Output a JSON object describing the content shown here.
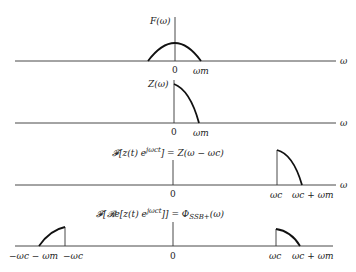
{
  "panels": [
    {
      "id": "F",
      "title": "F(ω)",
      "axis_symbol": "ω",
      "tick_labels": [
        "0",
        "ω_m"
      ],
      "ticks": {
        "zero": "0",
        "wm": "ωm"
      },
      "description": "Symmetric baseband spectrum from -ωm to ωm"
    },
    {
      "id": "Z",
      "title": "Z(ω)",
      "axis_symbol": "ω",
      "ticks": {
        "zero": "0",
        "wm": "ωm"
      },
      "description": "One-sided spectrum from 0 to ωm"
    },
    {
      "id": "Zshift",
      "title": "𝓕[z(t) e^{jω_c t}] = Z(ω − ω_c)",
      "title_parts": {
        "pre": "𝓕[z(t) e",
        "sup": "jωct",
        "post": "] = Z(ω − ωc)"
      },
      "axis_symbol": "ω",
      "ticks": {
        "zero": "0",
        "wc": "ωc",
        "wcwm": "ωc + ωm"
      },
      "description": "Shifted spectrum from ωc to ωc + ωm"
    },
    {
      "id": "SSB",
      "title": "𝓕[𝓡e[z(t) e^{jω_c t}]] = Φ_SSB+(ω)",
      "title_parts": {
        "pre": "𝓕[𝓡e[z(t) e",
        "sup": "jωct",
        "mid": "]] = Φ",
        "sub": "SSB+",
        "post": "(ω)"
      },
      "ticks": {
        "negwcwm": "−ωc − ωm",
        "negwc": "−ωc",
        "zero": "0",
        "wc": "ωc",
        "wcwm": "ωc + ωm"
      },
      "description": "Upper sideband spectrum mirrored at negative frequencies"
    }
  ]
}
